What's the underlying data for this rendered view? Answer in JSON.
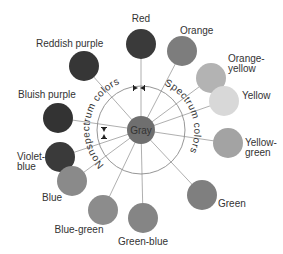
{
  "diagram": {
    "center": {
      "label": "Gray",
      "color": "#6f6f6f"
    },
    "arc_labels": {
      "nonspectrum": "Nonspectrum colors",
      "spectrum": "Spectrum colors"
    },
    "colors": [
      {
        "label": "Red",
        "shade": "#3a3a3a"
      },
      {
        "label": "Orange",
        "shade": "#7d7d7d"
      },
      {
        "label_line1": "Orange-",
        "label_line2": "yellow",
        "shade": "#b3b3b3"
      },
      {
        "label": "Yellow",
        "shade": "#d8d8d8"
      },
      {
        "label_line1": "Yellow-",
        "label_line2": "green",
        "shade": "#a3a3a3"
      },
      {
        "label": "Green",
        "shade": "#7f7f7f"
      },
      {
        "label": "Green-blue",
        "shade": "#858585"
      },
      {
        "label": "Blue-green",
        "shade": "#8c8c8c"
      },
      {
        "label": "Blue",
        "shade": "#8a8a8a"
      },
      {
        "label_line1": "Violet-",
        "label_line2": "blue",
        "shade": "#3a3a3a"
      },
      {
        "label": "Bluish purple",
        "shade": "#333333"
      },
      {
        "label": "Reddish purple",
        "shade": "#363636"
      }
    ]
  }
}
